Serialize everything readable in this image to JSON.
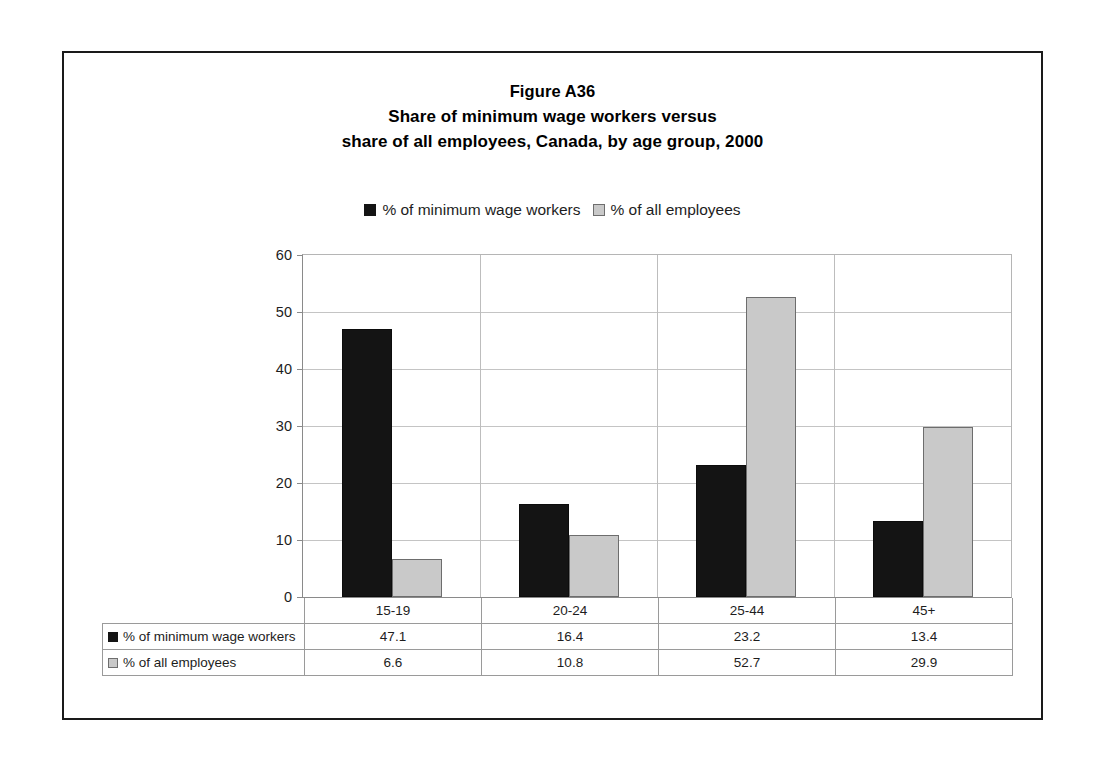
{
  "figure": {
    "title_lines": [
      "Figure A36",
      "Share of minimum wage workers versus",
      "share of all employees, Canada, by age group, 2000"
    ]
  },
  "legend": {
    "entries": [
      {
        "label": "% of minimum wage workers",
        "swatch": "dark-square-icon",
        "color": "#141414"
      },
      {
        "label": "% of all employees",
        "swatch": "light-square-icon",
        "color": "#c9c9c9"
      }
    ]
  },
  "axis": {
    "y_ticks": [
      "0",
      "10",
      "20",
      "30",
      "40",
      "50",
      "60"
    ]
  },
  "table": {
    "row_labels": [
      "% of minimum wage workers",
      "% of all employees"
    ],
    "category_headers": [
      "15-19",
      "20-24",
      "25-44",
      "45+"
    ],
    "rows": [
      [
        "47.1",
        "16.4",
        "23.2",
        "13.4"
      ],
      [
        "6.6",
        "10.8",
        "52.7",
        "29.9"
      ]
    ]
  },
  "chart_data": {
    "type": "bar",
    "xlabel": "",
    "ylabel": "",
    "categories": [
      "15-19",
      "20-24",
      "25-44",
      "45+"
    ],
    "series": [
      {
        "name": "% of minimum wage workers",
        "color": "#141414",
        "values": [
          47.1,
          16.4,
          23.2,
          13.4
        ]
      },
      {
        "name": "% of all employees",
        "color": "#c9c9c9",
        "values": [
          6.6,
          10.8,
          52.7,
          29.9
        ]
      }
    ],
    "ylim": [
      0,
      60
    ],
    "ytick_step": 10,
    "grid": "horizontal",
    "legend_position": "top-center"
  }
}
